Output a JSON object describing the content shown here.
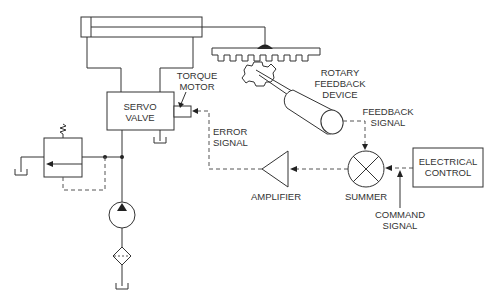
{
  "diagram": {
    "labels": {
      "servo_valve": [
        "SERVO",
        "VALVE"
      ],
      "torque_motor": [
        "TORQUE",
        "MOTOR"
      ],
      "rotary_feedback_device": [
        "ROTARY",
        "FEEDBACK",
        "DEVICE"
      ],
      "feedback_signal": [
        "FEEDBACK",
        "SIGNAL"
      ],
      "error_signal": [
        "ERROR",
        "SIGNAL"
      ],
      "amplifier": "AMPLIFIER",
      "summer": "SUMMER",
      "electrical_control": [
        "ELECTRICAL",
        "CONTROL"
      ],
      "command_signal": [
        "COMMAND",
        "SIGNAL"
      ]
    },
    "components": [
      "hydraulic-cylinder",
      "rack",
      "pinion-gear",
      "rotary-feedback-device",
      "servo-valve",
      "torque-motor",
      "relief-valve",
      "pump",
      "filter",
      "reservoir",
      "amplifier",
      "summer",
      "electrical-control"
    ],
    "colors": {
      "line": "#333333",
      "background": "#ffffff"
    }
  }
}
